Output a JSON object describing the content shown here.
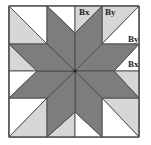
{
  "diagram": {
    "colors": {
      "dark": "#7d7d7d",
      "light": "#d6d6d6",
      "white": "#ffffff",
      "line": "#4a4a4a"
    },
    "labels": [
      {
        "id": "top-bx",
        "text": "Bx",
        "x": 79,
        "y": 15
      },
      {
        "id": "top-by",
        "text": "By",
        "x": 105,
        "y": 15
      },
      {
        "id": "right-by",
        "text": "By",
        "x": 128,
        "y": 42
      },
      {
        "id": "right-bx",
        "text": "Bx",
        "x": 128,
        "y": 67
      }
    ]
  }
}
